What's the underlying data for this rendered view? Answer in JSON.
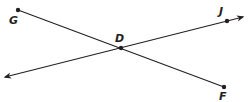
{
  "diagram": {
    "type": "geometry",
    "points": {
      "G": {
        "label": "G",
        "x": 18,
        "y": 10
      },
      "D": {
        "label": "D",
        "x": 121,
        "y": 48
      },
      "F": {
        "label": "F",
        "x": 224,
        "y": 87
      },
      "J": {
        "label": "J",
        "x": 227,
        "y": 21
      }
    },
    "segments": [
      {
        "name": "segment-GF",
        "from": "G",
        "to": "F"
      }
    ],
    "lines": [
      {
        "name": "line-DJ",
        "through": [
          "D",
          "J"
        ],
        "arrows": "both"
      }
    ],
    "colors": {
      "stroke": "#231f20",
      "label": "#231f20"
    }
  }
}
